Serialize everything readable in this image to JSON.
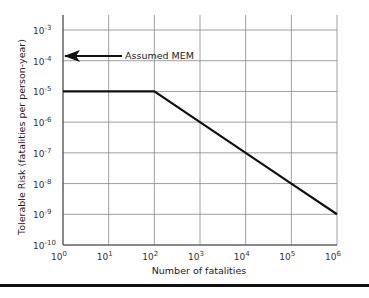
{
  "chart_data": {
    "type": "line",
    "title": "",
    "xlabel": "Number of fatalities",
    "ylabel": "Tolerable Risk (fatalities per person-year)",
    "x_scale": "log",
    "y_scale": "log",
    "xlim": [
      1,
      1000000
    ],
    "ylim": [
      1e-10,
      0.001
    ],
    "grid": true,
    "x_ticks": [
      "10^0",
      "10^1",
      "10^2",
      "10^3",
      "10^4",
      "10^5",
      "10^6"
    ],
    "y_ticks": [
      "10^-3",
      "10^-4",
      "10^-5",
      "10^-6",
      "10^-7",
      "10^-8",
      "10^-9",
      "10^-10"
    ],
    "series": [
      {
        "name": "Tolerable risk criterion",
        "x": [
          1,
          100,
          1000,
          10000,
          100000,
          1000000
        ],
        "values": [
          1e-05,
          1e-05,
          1e-06,
          1e-07,
          1e-08,
          1e-09
        ]
      }
    ],
    "annotations": [
      {
        "text": "Assumed MEM",
        "arrow_to": {
          "x": 1,
          "y": 0.0001
        }
      }
    ]
  },
  "labels": {
    "xlabel": "Number of fatalities",
    "ylabel": "Tolerable Risk (fatalities per person-year)",
    "annotation": "Assumed MEM",
    "x_base": [
      "10",
      "10",
      "10",
      "10",
      "10",
      "10",
      "10"
    ],
    "x_exp": [
      "0",
      "1",
      "2",
      "3",
      "4",
      "5",
      "6"
    ],
    "y_exp": [
      "-3",
      "-4",
      "-5",
      "-6",
      "-7",
      "-8",
      "-9",
      "-10"
    ]
  }
}
